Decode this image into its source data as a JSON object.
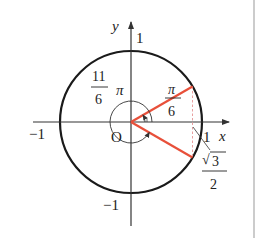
{
  "diagram": {
    "type": "unit-circle",
    "axes": {
      "x_label": "x",
      "y_label": "y",
      "origin_label": "O"
    },
    "ticks": {
      "x_pos": "1",
      "x_neg": "−1",
      "y_pos": "1",
      "y_neg": "−1"
    },
    "angles": {
      "small": {
        "numerator": "π",
        "denominator": "6"
      },
      "large": {
        "numerator": "11",
        "denominator": "6",
        "suffix": "π"
      }
    },
    "projection": {
      "numerator_radical": "√",
      "numerator_value": "3",
      "denominator": "2"
    },
    "colors": {
      "circle": "#1a1a1a",
      "axes": "#333333",
      "rays": "#e8503a",
      "dashed": "#e8a0a0",
      "border": "#999999"
    }
  }
}
